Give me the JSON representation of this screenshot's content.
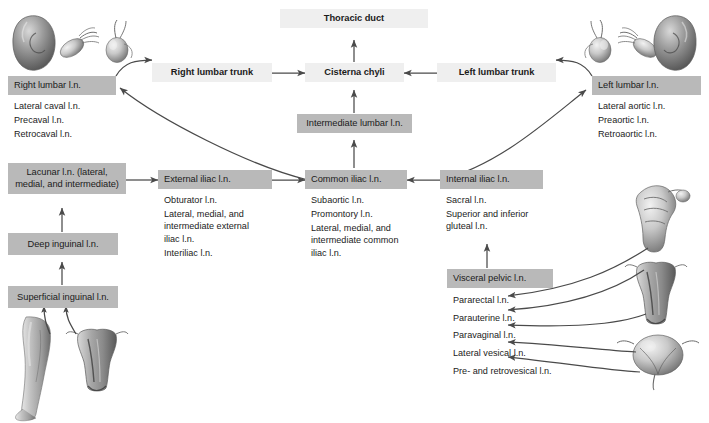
{
  "diagram": {
    "colors": {
      "header_box": "#b9b9b9",
      "trunk_box": "#efefef",
      "text": "#1b1b1b",
      "arrow": "#4a4a4a"
    },
    "nodes": {
      "thoracic_duct": "Thoracic duct",
      "cisterna_chyli": "Cisterna chyli",
      "right_lumbar_trunk": "Right lumbar trunk",
      "left_lumbar_trunk": "Left lumbar trunk",
      "intermediate_lumbar": "Intermediate lumbar l.n.",
      "right_lumbar": "Right lumbar l.n.",
      "left_lumbar": "Left lumbar l.n.",
      "lacunar": "Lacunar l.n. (lateral,\nmedial, and intermediate)",
      "external_iliac": "External iliac l.n.",
      "common_iliac": "Common iliac l.n.",
      "internal_iliac": "Internal iliac l.n.",
      "deep_inguinal": "Deep inguinal l.n.",
      "superficial_inguinal": "Superficial inguinal l.n.",
      "visceral_pelvic": "Visceral pelvic l.n."
    },
    "sublists": {
      "right_lumbar": [
        "Lateral caval l.n.",
        "Precaval l.n.",
        "Retrocaval l.n."
      ],
      "left_lumbar": [
        "Lateral aortic l.n.",
        "Preaortic l.n.",
        "Retroaortic l.n."
      ],
      "external_iliac": [
        "Obturator l.n.",
        "Lateral, medial, and\nintermediate external\niliac l.n.",
        "Interiliac l.n."
      ],
      "common_iliac": [
        "Subaortic l.n.",
        "Promontory l.n.",
        "Lateral, medial, and\nintermediate common\niliac l.n."
      ],
      "internal_iliac": [
        "Sacral l.n.",
        "Superior and inferior\ngluteal l.n."
      ],
      "visceral_pelvic": [
        "Pararectal l.n.",
        "Parauterine l.n.",
        "Paravaginal l.n.",
        "Lateral vesical l.n.",
        "Pre- and retrovesical l.n."
      ]
    },
    "illustrations": {
      "kidney_left": "kidney-illustration",
      "ovary_left": "ovary-tube-illustration",
      "testis_left": "testis-illustration",
      "testis_right": "testis-illustration",
      "ovary_right": "ovary-tube-illustration",
      "kidney_right": "kidney-illustration",
      "leg": "lower-limb-illustration",
      "uterus_bottom_left": "uterus-illustration",
      "rectum": "rectum-illustration",
      "uterus_right": "uterus-illustration",
      "bladder": "bladder-illustration"
    }
  }
}
